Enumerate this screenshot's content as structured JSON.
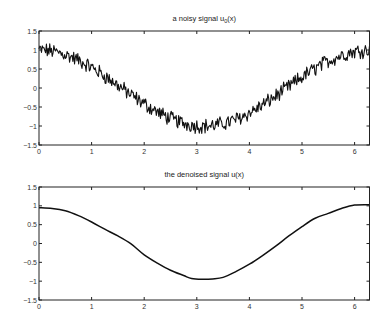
{
  "chart_data": [
    {
      "type": "line",
      "title": "a noisy signal u_0(x)",
      "title_main": "a noisy signal u",
      "title_sub": "0",
      "title_tail": "(x)",
      "xlabel": "",
      "ylabel": "",
      "xlim": [
        0,
        6.2832
      ],
      "ylim": [
        -1.5,
        1.5
      ],
      "xticks": [
        0,
        1,
        2,
        3,
        4,
        5,
        6
      ],
      "yticks": [
        1.5,
        1,
        0.5,
        0,
        -0.5,
        -1,
        -1.5
      ],
      "ytick_labels": [
        "1.5",
        "1",
        "0.5",
        "0",
        "−0.5",
        "−1",
        "−1.5"
      ],
      "grid": false,
      "series": [
        {
          "name": "u0",
          "description": "cos(x) plus random noise (amplitude ~0.15-0.2)",
          "base": "cos",
          "noise_amplitude": 0.17,
          "n_points": 400,
          "color": "#111111"
        }
      ]
    },
    {
      "type": "line",
      "title": "the denoised signal u(x)",
      "xlabel": "",
      "ylabel": "",
      "xlim": [
        0,
        6.2832
      ],
      "ylim": [
        -1.5,
        1.5
      ],
      "xticks": [
        0,
        1,
        2,
        3,
        4,
        5,
        6
      ],
      "yticks": [
        1.5,
        1,
        0.5,
        0,
        -0.5,
        -1,
        -1.5
      ],
      "ytick_labels": [
        "1.5",
        "1",
        "0.5",
        "0",
        "−0.5",
        "−1",
        "−1.5"
      ],
      "grid": false,
      "series": [
        {
          "name": "u",
          "color": "#111111",
          "x": [
            0,
            0.25,
            0.5,
            0.75,
            1.0,
            1.25,
            1.5,
            1.75,
            2.0,
            2.25,
            2.5,
            2.75,
            2.9,
            3.1,
            3.3,
            3.5,
            3.75,
            4.0,
            4.25,
            4.5,
            4.75,
            5.0,
            5.25,
            5.5,
            5.75,
            6.0,
            6.2832
          ],
          "y": [
            0.95,
            0.93,
            0.87,
            0.74,
            0.57,
            0.38,
            0.2,
            -0.01,
            -0.3,
            -0.52,
            -0.71,
            -0.85,
            -0.93,
            -0.95,
            -0.94,
            -0.9,
            -0.74,
            -0.55,
            -0.32,
            -0.07,
            0.2,
            0.45,
            0.67,
            0.8,
            0.93,
            1.02,
            1.03
          ]
        }
      ]
    }
  ]
}
